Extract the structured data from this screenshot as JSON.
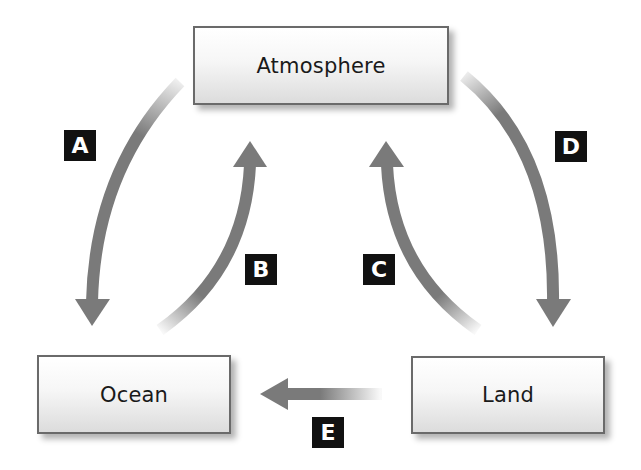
{
  "diagram": {
    "type": "cycle",
    "nodes": [
      {
        "id": "atmosphere",
        "label": "Atmosphere"
      },
      {
        "id": "ocean",
        "label": "Ocean"
      },
      {
        "id": "land",
        "label": "Land"
      }
    ],
    "edges": [
      {
        "id": "A",
        "label": "A",
        "from": "atmosphere",
        "to": "ocean"
      },
      {
        "id": "B",
        "label": "B",
        "from": "ocean",
        "to": "atmosphere"
      },
      {
        "id": "C",
        "label": "C",
        "from": "land",
        "to": "atmosphere"
      },
      {
        "id": "D",
        "label": "D",
        "from": "atmosphere",
        "to": "land"
      },
      {
        "id": "E",
        "label": "E",
        "from": "land",
        "to": "ocean"
      }
    ]
  },
  "colors": {
    "arrow": "#7a7a7a",
    "label_bg": "#111111",
    "label_text": "#ffffff",
    "box_border": "#6a6a6a"
  }
}
